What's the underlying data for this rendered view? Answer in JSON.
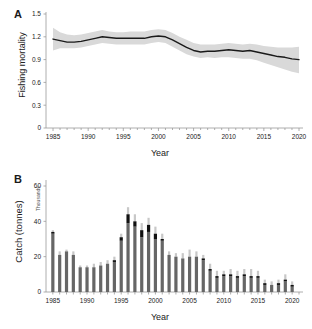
{
  "figure": {
    "panels": [
      {
        "letter": "A",
        "ylabel": "Fishing mortality",
        "xlabel": "Year"
      },
      {
        "letter": "B",
        "ylabel": "Catch (tonnes)",
        "xlabel": "Year",
        "scale_note": "Thousands"
      }
    ],
    "colors": {
      "line": "#1a1a1a",
      "ribbon": "#d9d9d9",
      "bar_body": "#666666",
      "bar_dark_segment": "#111111",
      "bar_error": "#c8c8c8",
      "axis": "#9a9a9a",
      "text": "#222222",
      "background": "#ffffff"
    }
  },
  "chart_data": [
    {
      "type": "line",
      "title": "",
      "panel": "A",
      "xlabel": "Year",
      "ylabel": "Fishing mortality",
      "xlim": [
        1984,
        2020
      ],
      "ylim": [
        0,
        1.5
      ],
      "yticks": [
        0,
        0.3,
        0.6,
        0.9,
        1.2,
        1.5
      ],
      "ytick_labels": [
        "0",
        "0.3",
        "0.6",
        "0.9",
        "1.2",
        "1.5"
      ],
      "xticks": [
        1985,
        1990,
        1995,
        2000,
        2005,
        2010,
        2015,
        2020
      ],
      "xtick_labels": [
        "1985",
        "1990",
        "1995",
        "2000",
        "2005",
        "2010",
        "2015",
        "2020"
      ],
      "grid": false,
      "legend": "none",
      "x": [
        1985,
        1986,
        1987,
        1988,
        1989,
        1990,
        1991,
        1992,
        1993,
        1994,
        1995,
        1996,
        1997,
        1998,
        1999,
        2000,
        2001,
        2002,
        2003,
        2004,
        2005,
        2006,
        2007,
        2008,
        2009,
        2010,
        2011,
        2012,
        2013,
        2014,
        2015,
        2016,
        2017,
        2018,
        2019,
        2020
      ],
      "series": [
        {
          "name": "Fishing mortality",
          "values": [
            1.17,
            1.15,
            1.13,
            1.13,
            1.14,
            1.16,
            1.18,
            1.2,
            1.19,
            1.18,
            1.18,
            1.18,
            1.18,
            1.18,
            1.2,
            1.21,
            1.2,
            1.16,
            1.11,
            1.06,
            1.02,
            1.0,
            1.01,
            1.01,
            1.02,
            1.03,
            1.02,
            1.01,
            1.02,
            1.0,
            0.98,
            0.96,
            0.94,
            0.93,
            0.91,
            0.9
          ]
        },
        {
          "name": "Confidence interval lower",
          "values": [
            1.02,
            1.05,
            1.05,
            1.05,
            1.06,
            1.08,
            1.1,
            1.12,
            1.11,
            1.1,
            1.1,
            1.1,
            1.1,
            1.1,
            1.12,
            1.13,
            1.12,
            1.07,
            1.02,
            0.97,
            0.94,
            0.92,
            0.93,
            0.92,
            0.93,
            0.93,
            0.92,
            0.91,
            0.91,
            0.89,
            0.86,
            0.83,
            0.8,
            0.77,
            0.74,
            0.72
          ]
        },
        {
          "name": "Confidence interval upper",
          "values": [
            1.32,
            1.26,
            1.23,
            1.22,
            1.23,
            1.25,
            1.27,
            1.29,
            1.27,
            1.26,
            1.26,
            1.27,
            1.27,
            1.27,
            1.29,
            1.3,
            1.29,
            1.25,
            1.2,
            1.16,
            1.12,
            1.1,
            1.1,
            1.1,
            1.11,
            1.12,
            1.11,
            1.1,
            1.11,
            1.1,
            1.08,
            1.07,
            1.06,
            1.06,
            1.06,
            1.07
          ]
        }
      ]
    },
    {
      "type": "bar",
      "title": "",
      "panel": "B",
      "xlabel": "Year",
      "ylabel": "Catch (tonnes)",
      "scale_note": "Thousands",
      "xlim": [
        1984,
        2021
      ],
      "ylim": [
        0,
        60
      ],
      "yticks": [
        0,
        20,
        40,
        60
      ],
      "ytick_labels": [
        "0",
        "20",
        "40",
        "60"
      ],
      "xticks": [
        1985,
        1990,
        1995,
        2000,
        2005,
        2010,
        2015,
        2020
      ],
      "xtick_labels": [
        "1985",
        "1990",
        "1995",
        "2000",
        "2005",
        "2010",
        "2015",
        "2020"
      ],
      "grid": false,
      "legend": "none",
      "categories": [
        1985,
        1986,
        1987,
        1988,
        1989,
        1990,
        1991,
        1992,
        1993,
        1994,
        1995,
        1996,
        1997,
        1998,
        1999,
        2000,
        2001,
        2002,
        2003,
        2004,
        2005,
        2006,
        2007,
        2008,
        2009,
        2010,
        2011,
        2012,
        2013,
        2014,
        2015,
        2016,
        2017,
        2018,
        2019,
        2020
      ],
      "values": [
        34,
        21,
        23,
        21,
        14,
        14,
        14,
        15,
        16,
        18,
        31,
        44,
        40,
        35,
        38,
        33,
        30,
        21,
        20,
        19,
        20,
        20,
        19,
        13,
        9,
        10,
        10,
        9,
        10,
        9,
        9,
        5,
        4,
        5,
        7,
        4
      ],
      "series": [
        {
          "name": "Catch (bar body, grey)",
          "values": [
            33,
            21,
            23,
            21,
            14,
            14,
            14,
            15,
            16,
            17,
            29,
            39,
            37,
            31,
            34,
            30,
            29,
            21,
            20,
            19,
            20,
            20,
            18,
            12,
            8,
            9,
            9,
            8,
            9,
            8,
            8,
            4,
            4,
            4,
            6,
            3
          ]
        },
        {
          "name": "Dark upper segment",
          "values": [
            1,
            0,
            0,
            0,
            0,
            0,
            0,
            0,
            0,
            1,
            2,
            5,
            3,
            4,
            4,
            3,
            1,
            0,
            0,
            0,
            0,
            0,
            1,
            1,
            1,
            1,
            1,
            1,
            1,
            1,
            1,
            1,
            0,
            1,
            1,
            1
          ]
        },
        {
          "name": "Error bar upper (light grey)",
          "values": [
            35,
            23,
            24,
            23,
            15,
            15,
            16,
            17,
            18,
            20,
            33,
            48,
            44,
            39,
            42,
            37,
            33,
            23,
            22,
            22,
            24,
            23,
            21,
            16,
            12,
            12,
            13,
            12,
            13,
            13,
            12,
            7,
            6,
            7,
            10,
            6
          ]
        }
      ]
    }
  ]
}
